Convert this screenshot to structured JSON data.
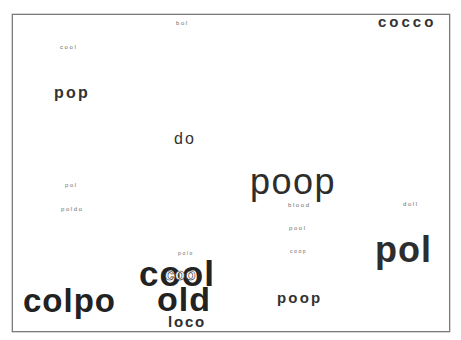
{
  "word_cloud": {
    "words": [
      {
        "text": "bol",
        "size": "tiny",
        "x": 176,
        "y": 23
      },
      {
        "text": "cocco",
        "size": "medium",
        "x": 378,
        "y": 21
      },
      {
        "text": "cool",
        "size": "tiny",
        "x": 60,
        "y": 47
      },
      {
        "text": "pop",
        "size": "medium",
        "x": 54,
        "y": 93
      },
      {
        "text": "do",
        "size": "medium",
        "x": 174,
        "y": 139
      },
      {
        "text": "poop",
        "size": "large",
        "x": 250,
        "y": 182
      },
      {
        "text": "pol",
        "size": "tiny",
        "x": 65,
        "y": 185
      },
      {
        "text": "blood",
        "size": "tiny",
        "x": 288,
        "y": 205
      },
      {
        "text": "doll",
        "size": "tiny",
        "x": 403,
        "y": 204
      },
      {
        "text": "poldo",
        "size": "tiny",
        "x": 61,
        "y": 209
      },
      {
        "text": "pool",
        "size": "tiny",
        "x": 289,
        "y": 228
      },
      {
        "text": "pol",
        "size": "large",
        "x": 375,
        "y": 250
      },
      {
        "text": "coop",
        "size": "tiny",
        "x": 290,
        "y": 251
      },
      {
        "text": "polo",
        "size": "tiny",
        "x": 178,
        "y": 253
      },
      {
        "text": "cool",
        "size": "xl",
        "x": 139,
        "y": 273
      },
      {
        "text": "coo",
        "size": "overlap",
        "x": 165,
        "y": 275
      },
      {
        "text": "colpo",
        "size": "xl",
        "x": 23,
        "y": 300
      },
      {
        "text": "old",
        "size": "xl",
        "x": 157,
        "y": 299
      },
      {
        "text": "poop",
        "size": "medium",
        "x": 277,
        "y": 297
      },
      {
        "text": "loco",
        "size": "medium",
        "x": 168,
        "y": 321
      }
    ]
  }
}
